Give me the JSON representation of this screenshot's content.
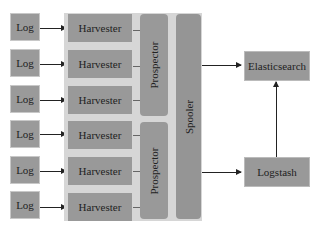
{
  "diagram": {
    "logs": [
      "Log",
      "Log",
      "Log",
      "Log",
      "Log",
      "Log"
    ],
    "harvesters": [
      "Harvester",
      "Harvester",
      "Harvester",
      "Harvester",
      "Harvester",
      "Harvester"
    ],
    "prospectors": [
      "Prospector",
      "Prospector"
    ],
    "spooler": "Spooler",
    "elasticsearch": "Elasticsearch",
    "logstash": "Logstash",
    "colors": {
      "box": "#9a9a9a",
      "container": "#d6d6d6",
      "arrow": "#222222",
      "background": "#ffffff"
    },
    "edges": [
      {
        "from": "log-1",
        "to": "harvester-1"
      },
      {
        "from": "log-2",
        "to": "harvester-2"
      },
      {
        "from": "log-3",
        "to": "harvester-3"
      },
      {
        "from": "log-4",
        "to": "harvester-4"
      },
      {
        "from": "log-5",
        "to": "harvester-5"
      },
      {
        "from": "log-6",
        "to": "harvester-6"
      },
      {
        "from": "spooler",
        "to": "elasticsearch"
      },
      {
        "from": "spooler",
        "to": "logstash"
      },
      {
        "from": "logstash",
        "to": "elasticsearch"
      }
    ]
  }
}
